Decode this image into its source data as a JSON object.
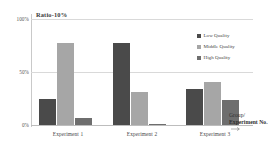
{
  "chart_data": {
    "type": "bar",
    "title": "Ratio-10%",
    "xlabel": "Group/ Experiment No.",
    "ylabel": "Ratio-10%",
    "categories": [
      "Experiment 1",
      "Experiment 2",
      "Experiment 3"
    ],
    "series": [
      {
        "name": "Low Quality",
        "color": "#4a4a4a",
        "values": [
          25,
          77,
          34
        ]
      },
      {
        "name": "Middle Quality",
        "color": "#a6a6a6",
        "values": [
          77,
          31,
          41
        ]
      },
      {
        "name": "High Quality",
        "color": "#6e6e6e",
        "values": [
          7,
          1,
          24
        ]
      }
    ],
    "ylim": [
      0,
      100
    ],
    "yticks": [
      "0%",
      "50%",
      "100%"
    ],
    "ytick_values": [
      0,
      50,
      100
    ],
    "grid": true,
    "legend_position": "top-right"
  },
  "axes": {
    "y_tick_100": "100%",
    "y_tick_50": "50%",
    "y_tick_0": "0%",
    "chart_title": "Ratio-10%",
    "x_title_line1": "Group/",
    "x_title_line2": "Experiment No."
  },
  "legend": {
    "items": [
      {
        "label": "Low Quality",
        "color": "#4a4a4a"
      },
      {
        "label": "Middle Quality",
        "color": "#a6a6a6"
      },
      {
        "label": "High Quality",
        "color": "#6e6e6e"
      }
    ]
  },
  "colors": {
    "low_quality": "#4a4a4a",
    "middle_quality": "#a6a6a6",
    "high_quality": "#6e6e6e",
    "gridline": "#d9d9d9",
    "axis": "#c9c9c9",
    "background": "#ffffff"
  }
}
